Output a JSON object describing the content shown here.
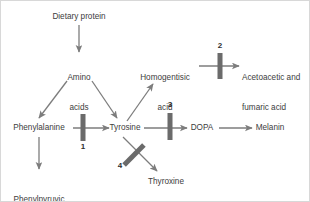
{
  "diagram": {
    "colors": {
      "background": "#ffffff",
      "arrow": "#7d7d7d",
      "block_bar": "#6b6b6b",
      "text": "#3d3d3d",
      "number": "#2e2e2e",
      "border": "#d8d8d8"
    },
    "nodes": [
      {
        "id": "dietary-protein",
        "label": "Dietary protein",
        "lines": [
          "Dietary protein"
        ],
        "x": 78,
        "y": 16,
        "align": "center"
      },
      {
        "id": "amino-acids",
        "label": "Amino acids",
        "lines": [
          "Amino",
          "acids"
        ],
        "x": 78,
        "y": 62,
        "align": "center"
      },
      {
        "id": "phenylalanine",
        "label": "Phenylalanine",
        "lines": [
          "Phenylalanine"
        ],
        "x": 38,
        "y": 127,
        "align": "center"
      },
      {
        "id": "tyrosine",
        "label": "Tyrosine",
        "lines": [
          "Tyrosine"
        ],
        "x": 124,
        "y": 127,
        "align": "center"
      },
      {
        "id": "phenylpyruvic-acid",
        "label": "Phenylpyruvic acid",
        "lines": [
          "Phenylpyruvic",
          "acid"
        ],
        "x": 38,
        "y": 180,
        "align": "center"
      },
      {
        "id": "homogentisic-acid",
        "label": "Homogentisic acid",
        "lines": [
          "Homogentisic",
          "acid"
        ],
        "x": 164,
        "y": 62,
        "align": "center"
      },
      {
        "id": "acetoacetic-fumaric",
        "label": "Acetoacetic and fumaric acid",
        "lines": [
          "Acetoacetic and",
          "fumaric acid"
        ],
        "x": 241,
        "y": 62,
        "align": "left"
      },
      {
        "id": "dopa",
        "label": "DOPA",
        "lines": [
          "DOPA"
        ],
        "x": 201,
        "y": 127,
        "align": "center"
      },
      {
        "id": "melanin",
        "label": "Melanin",
        "lines": [
          "Melanin"
        ],
        "x": 268,
        "y": 127,
        "align": "center"
      },
      {
        "id": "thyroxine",
        "label": "Thyroxine",
        "lines": [
          "Thyroxine"
        ],
        "x": 164,
        "y": 181,
        "align": "center"
      }
    ],
    "edges": [
      {
        "id": "edge-protein-to-amino",
        "from": "dietary-protein",
        "to": "amino-acids"
      },
      {
        "id": "edge-amino-to-phenylalanine",
        "from": "amino-acids",
        "to": "phenylalanine"
      },
      {
        "id": "edge-amino-to-tyrosine",
        "from": "amino-acids",
        "to": "tyrosine"
      },
      {
        "id": "edge-phenylalanine-to-tyrosine",
        "from": "phenylalanine",
        "to": "tyrosine"
      },
      {
        "id": "edge-phenylalanine-to-phenylpyruvic",
        "from": "phenylalanine",
        "to": "phenylpyruvic-acid"
      },
      {
        "id": "edge-tyrosine-to-homogentisic",
        "from": "tyrosine",
        "to": "homogentisic-acid"
      },
      {
        "id": "edge-homogentisic-to-acetoacetic",
        "from": "homogentisic-acid",
        "to": "acetoacetic-fumaric"
      },
      {
        "id": "edge-tyrosine-to-dopa",
        "from": "tyrosine",
        "to": "dopa"
      },
      {
        "id": "edge-dopa-to-melanin",
        "from": "dopa",
        "to": "melanin"
      },
      {
        "id": "edge-tyrosine-to-thyroxine",
        "from": "tyrosine",
        "to": "thyroxine"
      }
    ],
    "blocks": [
      {
        "id": "block-1",
        "number": "1",
        "on_edge": "edge-phenylalanine-to-tyrosine",
        "orientation": "vertical",
        "label_position": "below",
        "x": 82,
        "y": 127,
        "number_x": 82,
        "number_y": 145
      },
      {
        "id": "block-2",
        "number": "2",
        "on_edge": "edge-homogentisic-to-acetoacetic",
        "orientation": "vertical",
        "label_position": "above",
        "x": 219,
        "y": 65,
        "number_x": 219,
        "number_y": 45
      },
      {
        "id": "block-3",
        "number": "3",
        "on_edge": "edge-tyrosine-to-dopa",
        "orientation": "vertical",
        "label_position": "above",
        "x": 169,
        "y": 126,
        "number_x": 169,
        "number_y": 104
      },
      {
        "id": "block-4",
        "number": "4",
        "on_edge": "edge-tyrosine-to-thyroxine",
        "orientation": "diagonal",
        "label_position": "left",
        "x": 133,
        "y": 154,
        "number_x": 119,
        "number_y": 165
      }
    ]
  }
}
